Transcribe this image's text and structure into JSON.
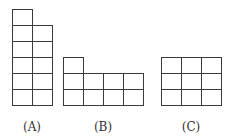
{
  "diagram": {
    "cell_width": 20,
    "cell_height": 16,
    "line_color": "#3a3a3a",
    "figures": [
      {
        "label": "(A)",
        "origin": [
          12,
          9
        ],
        "label_pos": [
          32,
          120
        ],
        "columns": [
          {
            "col": 0,
            "height": 6
          },
          {
            "col": 1,
            "height": 5
          }
        ],
        "max_height": 6
      },
      {
        "label": "(B)",
        "origin": [
          63,
          57
        ],
        "label_pos": [
          103,
          120
        ],
        "columns": [
          {
            "col": 0,
            "height": 3
          },
          {
            "col": 1,
            "height": 2
          },
          {
            "col": 2,
            "height": 2
          },
          {
            "col": 3,
            "height": 2
          }
        ],
        "max_height": 3
      },
      {
        "label": "(C)",
        "origin": [
          161,
          57
        ],
        "label_pos": [
          191,
          120
        ],
        "columns": [
          {
            "col": 0,
            "height": 3
          },
          {
            "col": 1,
            "height": 3
          },
          {
            "col": 2,
            "height": 3
          }
        ],
        "max_height": 3
      }
    ]
  }
}
